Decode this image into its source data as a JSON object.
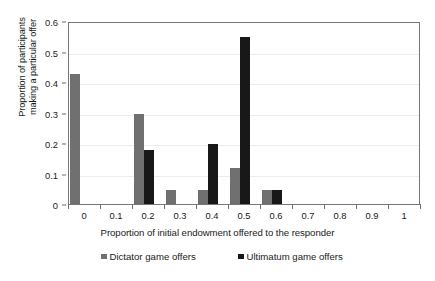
{
  "chart_data": {
    "type": "bar",
    "title": "",
    "xlabel": "Proportion of initial endowment offered to the responder",
    "ylabel": "Proportion of participants making a particular offer",
    "ylabel_lines": [
      "Proportion of participants",
      "making a particular offer"
    ],
    "categories": [
      "0",
      "0.1",
      "0.2",
      "0.3",
      "0.4",
      "0.5",
      "0.6",
      "0.7",
      "0.8",
      "0.9",
      "1"
    ],
    "xtick_labels": [
      "0",
      "0.1",
      "0.2",
      "0.3",
      "0.4",
      "0.5",
      "0.6",
      "0.7",
      "0.8",
      "0.9",
      "1"
    ],
    "ytick_labels": [
      "0",
      "0.1",
      "0.2",
      "0.3",
      "0.4",
      "0.5",
      "0.6"
    ],
    "ytick_values": [
      0,
      0.1,
      0.2,
      0.3,
      0.4,
      0.5,
      0.6
    ],
    "ylim": [
      0,
      0.6
    ],
    "grid": "horizontal",
    "legend_position": "bottom",
    "series": [
      {
        "name": "Dictator game offers",
        "color": "#707070",
        "values": [
          0.43,
          0,
          0.3,
          0.05,
          0.05,
          0.12,
          0.05,
          0,
          0,
          0,
          0
        ]
      },
      {
        "name": "Ultimatum game offers",
        "color": "#181818",
        "values": [
          0,
          0,
          0.18,
          0,
          0.2,
          0.55,
          0.05,
          0,
          0,
          0,
          0
        ]
      }
    ]
  },
  "legend": {
    "entries": [
      {
        "label": "Dictator game offers",
        "color": "#707070"
      },
      {
        "label": "Ultimatum game offers",
        "color": "#181818"
      }
    ]
  },
  "colors": {
    "dictator": "#707070",
    "ultimatum": "#181818",
    "axis": "#767676",
    "gridline": "#ededed",
    "background": "#ffffff"
  }
}
